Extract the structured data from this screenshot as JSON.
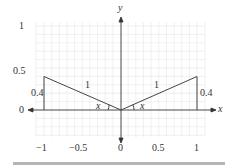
{
  "diagram": {
    "axes": {
      "x_label": "x",
      "y_label": "y",
      "x_ticks": [
        "−1",
        "−0.5",
        "0",
        "0.5",
        "1"
      ],
      "y_ticks": [
        "1",
        "0.5",
        "0"
      ]
    },
    "left_triangle": {
      "hypotenuse_label": "1",
      "height_label": "0.4",
      "angle_label": "x"
    },
    "right_triangle": {
      "hypotenuse_label": "1",
      "height_label": "0.4",
      "angle_label": "x"
    },
    "colors": {
      "grid": "#e6e6e6",
      "axis": "#333333",
      "triangle": "#444444",
      "separator": "#b5b5b5"
    }
  }
}
